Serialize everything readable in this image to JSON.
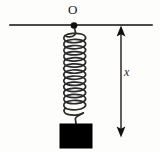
{
  "figure": {
    "title_label": "O",
    "displacement_label": "x",
    "background_color": "#fdfdfc",
    "ink_color": "#1a1a1a",
    "support_line_color": "#4a4a4a",
    "spring_color": "#2a2a2a",
    "block_color": "#000000",
    "arrow_color": "#1a1a1a",
    "elements": {
      "support_line": {
        "name": "support-line",
        "x1": 10,
        "y1": 25,
        "x2": 152,
        "y2": 25,
        "thickness": 2
      },
      "anchor_point": {
        "name": "anchor-dot",
        "cx": 74,
        "cy": 25,
        "r": 3.2
      },
      "spring": {
        "name": "spring-coil",
        "coil_count": 13,
        "top_y": 32,
        "bottom_y": 113,
        "left_x": 63,
        "right_x": 86,
        "wire_width": 1.6
      },
      "block": {
        "name": "hanging-mass-block",
        "x": 60,
        "y": 124,
        "width": 32,
        "height": 24
      },
      "measure_arrow": {
        "name": "displacement-arrow",
        "x": 121,
        "top_y": 26,
        "bottom_y": 137,
        "head_width": 9,
        "head_height": 11,
        "shaft_width": 1.4
      }
    }
  }
}
